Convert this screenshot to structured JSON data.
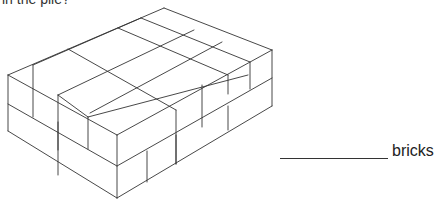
{
  "question": {
    "text": "in the pile?"
  },
  "diagram": {
    "line_color": "#333333",
    "lines": [
      [
        164,
        8,
        8,
        75
      ],
      [
        164,
        8,
        272,
        50
      ],
      [
        8,
        75,
        117,
        135
      ],
      [
        272,
        50,
        117,
        135
      ],
      [
        8,
        75,
        8,
        131
      ],
      [
        117,
        135,
        117,
        198
      ],
      [
        272,
        50,
        272,
        106
      ],
      [
        8,
        104,
        117,
        166
      ],
      [
        117,
        166,
        272,
        78
      ],
      [
        8,
        131,
        117,
        198
      ],
      [
        117,
        198,
        272,
        106
      ],
      [
        68,
        49,
        176,
        110
      ],
      [
        118,
        28,
        228,
        75
      ],
      [
        141,
        18,
        250,
        62
      ],
      [
        33,
        65,
        141,
        18
      ],
      [
        58,
        95,
        194,
        30
      ],
      [
        90,
        113,
        222,
        42
      ],
      [
        33,
        65,
        33,
        117
      ],
      [
        58,
        95,
        58,
        150
      ],
      [
        88,
        117,
        88,
        149
      ],
      [
        58,
        95,
        88,
        117
      ],
      [
        88,
        117,
        248,
        75
      ],
      [
        176,
        110,
        176,
        164
      ],
      [
        202,
        85,
        202,
        127
      ],
      [
        228,
        75,
        228,
        94
      ],
      [
        250,
        62,
        250,
        89
      ],
      [
        147,
        151,
        147,
        182
      ],
      [
        176,
        164,
        176,
        135
      ],
      [
        228,
        106,
        228,
        130
      ],
      [
        58,
        122,
        58,
        175
      ]
    ]
  },
  "answer": {
    "blank": "",
    "unit": "bricks"
  }
}
